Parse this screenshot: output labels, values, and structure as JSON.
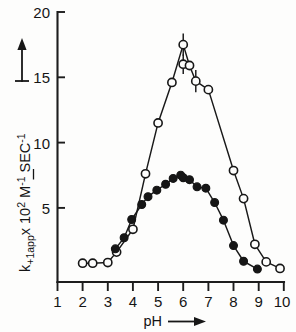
{
  "figure": {
    "name": "ph-rate-profile",
    "background_color": "#fdfdfc",
    "ink_color": "#171717"
  },
  "axes": {
    "y": {
      "label_main": "k",
      "label_sub": "+1app",
      "label_times": "x 10",
      "label_exp": "2",
      "label_units_m": "M",
      "label_units_m_exp": "-1",
      "label_units_sec": "SEC",
      "label_units_sec_exp": "-1",
      "label_full": "k+1app x 10² M⁻¹ SEC⁻¹",
      "ticks": [
        "5",
        "10",
        "15",
        "20"
      ],
      "tick_values": [
        5,
        10,
        15,
        20
      ],
      "range": [
        0,
        20
      ],
      "arrow": "up-arrow"
    },
    "x": {
      "label": "pH",
      "arrow": "right-arrow",
      "ticks": [
        "1",
        "2",
        "3",
        "4",
        "5",
        "6",
        "7",
        "8",
        "9",
        "10"
      ],
      "tick_values": [
        1,
        2,
        3,
        4,
        5,
        6,
        7,
        8,
        9,
        10
      ],
      "range": [
        1,
        10
      ]
    }
  },
  "chart_data": {
    "type": "line",
    "title": "",
    "xlabel": "pH",
    "ylabel": "k+1app x 10² M⁻¹ SEC⁻¹",
    "xlim": [
      1,
      10
    ],
    "ylim": [
      0,
      20
    ],
    "grid": false,
    "legend": "none",
    "series": [
      {
        "name": "open-circles",
        "marker": "open-circle",
        "linestyle": "solid",
        "points": [
          {
            "x": 2.0,
            "y": 0.75
          },
          {
            "x": 2.4,
            "y": 0.75
          },
          {
            "x": 3.0,
            "y": 0.8
          },
          {
            "x": 3.35,
            "y": 1.6
          },
          {
            "x": 4.0,
            "y": 3.35
          },
          {
            "x": 4.5,
            "y": 7.6
          },
          {
            "x": 5.0,
            "y": 11.5
          },
          {
            "x": 5.55,
            "y": 14.6
          },
          {
            "x": 6.0,
            "y": 17.5,
            "yerr": 0.85
          },
          {
            "x": 6.0,
            "y": 16.0,
            "yerr": 0.75
          },
          {
            "x": 6.25,
            "y": 15.9
          },
          {
            "x": 6.5,
            "y": 14.7,
            "yerr": 0.85
          },
          {
            "x": 7.0,
            "y": 14.05
          },
          {
            "x": 8.0,
            "y": 7.85
          },
          {
            "x": 8.4,
            "y": 5.7
          },
          {
            "x": 8.85,
            "y": 2.2
          },
          {
            "x": 9.3,
            "y": 0.85
          },
          {
            "x": 9.85,
            "y": 0.35
          }
        ]
      },
      {
        "name": "filled-circles",
        "marker": "filled-circle",
        "linestyle": "solid",
        "points": [
          {
            "x": 3.3,
            "y": 1.85
          },
          {
            "x": 3.65,
            "y": 2.7
          },
          {
            "x": 3.95,
            "y": 4.1
          },
          {
            "x": 4.35,
            "y": 5.25
          },
          {
            "x": 4.6,
            "y": 5.85
          },
          {
            "x": 4.95,
            "y": 6.35
          },
          {
            "x": 5.3,
            "y": 6.8
          },
          {
            "x": 5.6,
            "y": 7.25
          },
          {
            "x": 5.9,
            "y": 7.5
          },
          {
            "x": 6.0,
            "y": 7.3
          },
          {
            "x": 6.25,
            "y": 7.15
          },
          {
            "x": 6.55,
            "y": 6.6
          },
          {
            "x": 6.9,
            "y": 6.5
          },
          {
            "x": 7.25,
            "y": 5.4
          },
          {
            "x": 7.6,
            "y": 4.05
          },
          {
            "x": 8.0,
            "y": 2.1
          },
          {
            "x": 8.4,
            "y": 0.9
          },
          {
            "x": 8.95,
            "y": 0.3
          }
        ]
      }
    ]
  }
}
